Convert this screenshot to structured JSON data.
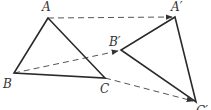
{
  "diagram": {
    "colors": {
      "line": "#2a2a2a",
      "dash": "#555555",
      "label": "#333333",
      "background": "#ffffff"
    },
    "original": {
      "labels": {
        "A": "A",
        "B": "B",
        "C": "C"
      },
      "points": {
        "A": [
          48,
          18
        ],
        "B": [
          14,
          73
        ],
        "C": [
          105,
          78
        ]
      }
    },
    "image": {
      "labels": {
        "A": "A′",
        "B": "B′",
        "C": "C′"
      },
      "points": {
        "A": [
          175,
          17
        ],
        "B": [
          121,
          50
        ],
        "C": [
          196,
          102
        ]
      }
    },
    "translation_vectors": [
      {
        "from": "A",
        "to": "A′",
        "style": "dashed-arrow"
      },
      {
        "from": "B",
        "to": "B′",
        "style": "dashed-arrow"
      },
      {
        "from": "C",
        "to": "C′",
        "style": "dashed-arrow"
      }
    ]
  }
}
